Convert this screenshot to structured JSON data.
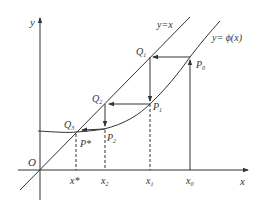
{
  "diagram": {
    "axes": {
      "x_label": "x",
      "y_label": "y",
      "origin_label": "O"
    },
    "curves": {
      "identity_label": "y=x",
      "phi_label": "y= ϕ(x)"
    },
    "points": {
      "P0": "P",
      "P0_sub": "0",
      "P1": "P",
      "P1_sub": "1",
      "P2": "P",
      "P2_sub": "2",
      "Pstar": "P*",
      "Q1": "Q",
      "Q1_sub": "1",
      "Q2": "Q",
      "Q2_sub": "2",
      "Q3": "Q",
      "Q3_sub": "3"
    },
    "ticks": {
      "xstar": "x*",
      "x2": "x",
      "x2_sub": "2",
      "x1": "x",
      "x1_sub": "1",
      "x0": "x",
      "x0_sub": "0"
    },
    "colors": {
      "stroke": "#333333",
      "background": "#ffffff"
    }
  }
}
